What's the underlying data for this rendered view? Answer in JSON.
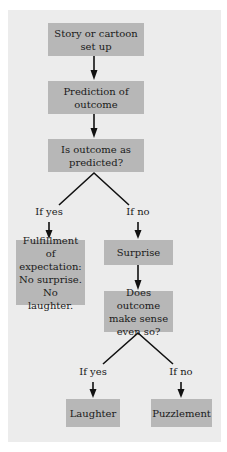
{
  "nodes": {
    "setup": "Story or cartoon set up",
    "prediction": "Prediction of outcome",
    "question1": "Is outcome as predicted?",
    "fulfillment": "Fulfillment of expectation: No surprise. No laughter.",
    "surprise": "Surprise",
    "question2": "Does outcome make sense even so?",
    "laughter": "Laughter",
    "puzzlement": "Puzzlement"
  },
  "branches": {
    "q1_yes": "If yes",
    "q1_no": "If no",
    "q2_yes": "If yes",
    "q2_no": "If no"
  },
  "colors": {
    "box": "#b7b7b7",
    "panel": "#ececec",
    "line": "#111111"
  }
}
